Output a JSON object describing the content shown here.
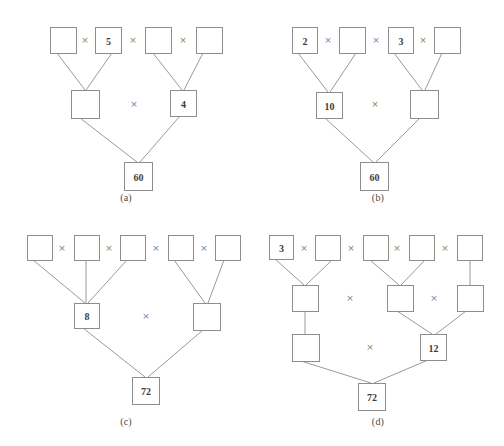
{
  "sheet": {
    "width": 504,
    "height": 446,
    "background": "#ffffff",
    "box_stroke": "#8d8d8d",
    "edge_stroke": "#9a9a9a",
    "text_color": "#3d3d3d",
    "operator_color": "#7e7e7e",
    "operator_symbol": "×"
  },
  "panels": [
    {
      "id": "a",
      "caption": "(a)",
      "origin": {
        "x": 0,
        "y": 0
      },
      "caption_y": 192,
      "boxes": [
        {
          "name": "a-top-1",
          "value": "",
          "x": 50,
          "y": 27,
          "w": 26,
          "h": 26
        },
        {
          "name": "a-top-2",
          "value": "5",
          "x": 95,
          "y": 27,
          "w": 26,
          "h": 26
        },
        {
          "name": "a-top-3",
          "value": "",
          "x": 145,
          "y": 27,
          "w": 26,
          "h": 26
        },
        {
          "name": "a-top-4",
          "value": "",
          "x": 196,
          "y": 27,
          "w": 26,
          "h": 26
        },
        {
          "name": "a-mid-1",
          "value": "",
          "x": 71,
          "y": 90,
          "w": 28,
          "h": 28
        },
        {
          "name": "a-mid-2",
          "value": "4",
          "x": 170,
          "y": 90,
          "w": 26,
          "h": 26
        },
        {
          "name": "a-root",
          "value": "60",
          "x": 124,
          "y": 162,
          "w": 28,
          "h": 28
        }
      ],
      "operators": [
        {
          "name": "a-op-top-1",
          "x": 85,
          "y": 40
        },
        {
          "name": "a-op-top-2",
          "x": 133,
          "y": 40
        },
        {
          "name": "a-op-top-3",
          "x": 183,
          "y": 40
        },
        {
          "name": "a-op-mid-1",
          "x": 134,
          "y": 104
        }
      ],
      "edges": [
        {
          "name": "a-edge-t1-m1",
          "x1": 57,
          "y1": 53,
          "x2": 85,
          "y2": 90
        },
        {
          "name": "a-edge-t2-m1",
          "x1": 112,
          "y1": 53,
          "x2": 86,
          "y2": 90
        },
        {
          "name": "a-edge-t3-m2",
          "x1": 153,
          "y1": 53,
          "x2": 182,
          "y2": 90
        },
        {
          "name": "a-edge-t4-m2",
          "x1": 203,
          "y1": 53,
          "x2": 184,
          "y2": 90
        },
        {
          "name": "a-edge-m1-root",
          "x1": 80,
          "y1": 118,
          "x2": 137,
          "y2": 162
        },
        {
          "name": "a-edge-m2-root",
          "x1": 180,
          "y1": 116,
          "x2": 140,
          "y2": 162
        }
      ]
    },
    {
      "id": "b",
      "caption": "(b)",
      "origin": {
        "x": 252,
        "y": 0
      },
      "caption_y": 192,
      "boxes": [
        {
          "name": "b-top-1",
          "value": "2",
          "x": 40,
          "y": 27,
          "w": 25,
          "h": 26
        },
        {
          "name": "b-top-2",
          "value": "",
          "x": 87,
          "y": 27,
          "w": 26,
          "h": 26
        },
        {
          "name": "b-top-3",
          "value": "3",
          "x": 136,
          "y": 27,
          "w": 25,
          "h": 26
        },
        {
          "name": "b-top-4",
          "value": "",
          "x": 182,
          "y": 27,
          "w": 26,
          "h": 26
        },
        {
          "name": "b-mid-1",
          "value": "10",
          "x": 64,
          "y": 92,
          "w": 26,
          "h": 26
        },
        {
          "name": "b-mid-2",
          "value": "",
          "x": 158,
          "y": 90,
          "w": 28,
          "h": 28
        },
        {
          "name": "b-root",
          "value": "60",
          "x": 108,
          "y": 162,
          "w": 28,
          "h": 28
        }
      ],
      "operators": [
        {
          "name": "b-op-top-1",
          "x": 76,
          "y": 40
        },
        {
          "name": "b-op-top-2",
          "x": 124,
          "y": 40
        },
        {
          "name": "b-op-top-3",
          "x": 171,
          "y": 40
        },
        {
          "name": "b-op-mid-1",
          "x": 123,
          "y": 104
        }
      ],
      "edges": [
        {
          "name": "b-edge-t1-m1",
          "x1": 46,
          "y1": 53,
          "x2": 76,
          "y2": 92
        },
        {
          "name": "b-edge-t2-m1",
          "x1": 104,
          "y1": 53,
          "x2": 78,
          "y2": 92
        },
        {
          "name": "b-edge-t3-m2",
          "x1": 142,
          "y1": 53,
          "x2": 170,
          "y2": 90
        },
        {
          "name": "b-edge-t4-m2",
          "x1": 190,
          "y1": 53,
          "x2": 173,
          "y2": 90
        },
        {
          "name": "b-edge-m1-root",
          "x1": 73,
          "y1": 118,
          "x2": 121,
          "y2": 162
        },
        {
          "name": "b-edge-m2-root",
          "x1": 168,
          "y1": 118,
          "x2": 124,
          "y2": 162
        }
      ]
    },
    {
      "id": "c",
      "caption": "(c)",
      "origin": {
        "x": 0,
        "y": 223
      },
      "caption_y": 193,
      "boxes": [
        {
          "name": "c-top-1",
          "value": "",
          "x": 27,
          "y": 12,
          "w": 25,
          "h": 25
        },
        {
          "name": "c-top-2",
          "value": "",
          "x": 74,
          "y": 12,
          "w": 25,
          "h": 25
        },
        {
          "name": "c-top-3",
          "value": "",
          "x": 120,
          "y": 12,
          "w": 25,
          "h": 25
        },
        {
          "name": "c-top-4",
          "value": "",
          "x": 168,
          "y": 12,
          "w": 25,
          "h": 25
        },
        {
          "name": "c-top-5",
          "value": "",
          "x": 215,
          "y": 12,
          "w": 25,
          "h": 25
        },
        {
          "name": "c-mid-1",
          "value": "8",
          "x": 74,
          "y": 80,
          "w": 25,
          "h": 25
        },
        {
          "name": "c-mid-2",
          "value": "",
          "x": 193,
          "y": 80,
          "w": 27,
          "h": 27
        },
        {
          "name": "c-root",
          "value": "72",
          "x": 132,
          "y": 154,
          "w": 27,
          "h": 27
        }
      ],
      "operators": [
        {
          "name": "c-op-top-1",
          "x": 62,
          "y": 25
        },
        {
          "name": "c-op-top-2",
          "x": 109,
          "y": 25
        },
        {
          "name": "c-op-top-3",
          "x": 156,
          "y": 25
        },
        {
          "name": "c-op-top-4",
          "x": 204,
          "y": 25
        },
        {
          "name": "c-op-mid-1",
          "x": 146,
          "y": 93
        }
      ],
      "edges": [
        {
          "name": "c-edge-t1-m1",
          "x1": 33,
          "y1": 37,
          "x2": 85,
          "y2": 80
        },
        {
          "name": "c-edge-t2-m1",
          "x1": 86,
          "y1": 37,
          "x2": 86,
          "y2": 80
        },
        {
          "name": "c-edge-t3-m1",
          "x1": 127,
          "y1": 37,
          "x2": 88,
          "y2": 80
        },
        {
          "name": "c-edge-t4-m2",
          "x1": 174,
          "y1": 37,
          "x2": 205,
          "y2": 80
        },
        {
          "name": "c-edge-t5-m2",
          "x1": 224,
          "y1": 37,
          "x2": 208,
          "y2": 80
        },
        {
          "name": "c-edge-m1-root",
          "x1": 83,
          "y1": 105,
          "x2": 145,
          "y2": 154
        },
        {
          "name": "c-edge-m2-root",
          "x1": 203,
          "y1": 107,
          "x2": 148,
          "y2": 154
        }
      ]
    },
    {
      "id": "d",
      "caption": "(d)",
      "origin": {
        "x": 252,
        "y": 223
      },
      "caption_y": 193,
      "boxes": [
        {
          "name": "d-top-1",
          "value": "3",
          "x": 17,
          "y": 12,
          "w": 24,
          "h": 24
        },
        {
          "name": "d-top-2",
          "value": "",
          "x": 63,
          "y": 12,
          "w": 25,
          "h": 25
        },
        {
          "name": "d-top-3",
          "value": "",
          "x": 111,
          "y": 12,
          "w": 25,
          "h": 25
        },
        {
          "name": "d-top-4",
          "value": "",
          "x": 157,
          "y": 12,
          "w": 25,
          "h": 25
        },
        {
          "name": "d-top-5",
          "value": "",
          "x": 205,
          "y": 12,
          "w": 25,
          "h": 25
        },
        {
          "name": "d-mid-1",
          "value": "",
          "x": 40,
          "y": 62,
          "w": 26,
          "h": 26
        },
        {
          "name": "d-mid-2",
          "value": "",
          "x": 135,
          "y": 62,
          "w": 26,
          "h": 26
        },
        {
          "name": "d-mid-3",
          "value": "",
          "x": 205,
          "y": 62,
          "w": 26,
          "h": 26
        },
        {
          "name": "d-low-1",
          "value": "",
          "x": 40,
          "y": 111,
          "w": 27,
          "h": 27
        },
        {
          "name": "d-low-2",
          "value": "12",
          "x": 168,
          "y": 111,
          "w": 26,
          "h": 26
        },
        {
          "name": "d-root",
          "value": "72",
          "x": 106,
          "y": 160,
          "w": 27,
          "h": 27
        }
      ],
      "operators": [
        {
          "name": "d-op-top-1",
          "x": 52,
          "y": 25
        },
        {
          "name": "d-op-top-2",
          "x": 99,
          "y": 25
        },
        {
          "name": "d-op-top-3",
          "x": 145,
          "y": 25
        },
        {
          "name": "d-op-top-4",
          "x": 193,
          "y": 25
        },
        {
          "name": "d-op-mid-1",
          "x": 98,
          "y": 75
        },
        {
          "name": "d-op-mid-2",
          "x": 182,
          "y": 75
        },
        {
          "name": "d-op-low-1",
          "x": 118,
          "y": 124
        }
      ],
      "edges": [
        {
          "name": "d-edge-t1-m1",
          "x1": 23,
          "y1": 36,
          "x2": 52,
          "y2": 62
        },
        {
          "name": "d-edge-t2-m1",
          "x1": 80,
          "y1": 37,
          "x2": 54,
          "y2": 62
        },
        {
          "name": "d-edge-t3-m2",
          "x1": 118,
          "y1": 37,
          "x2": 147,
          "y2": 62
        },
        {
          "name": "d-edge-t4-m2",
          "x1": 173,
          "y1": 37,
          "x2": 149,
          "y2": 62
        },
        {
          "name": "d-edge-t5-m3",
          "x1": 218,
          "y1": 37,
          "x2": 218,
          "y2": 62
        },
        {
          "name": "d-edge-m1-l1",
          "x1": 53,
          "y1": 88,
          "x2": 53,
          "y2": 111
        },
        {
          "name": "d-edge-m2-l2",
          "x1": 145,
          "y1": 88,
          "x2": 180,
          "y2": 111
        },
        {
          "name": "d-edge-m3-l2",
          "x1": 214,
          "y1": 88,
          "x2": 184,
          "y2": 111
        },
        {
          "name": "d-edge-l1-root",
          "x1": 49,
          "y1": 138,
          "x2": 119,
          "y2": 160
        },
        {
          "name": "d-edge-l2-root",
          "x1": 176,
          "y1": 137,
          "x2": 122,
          "y2": 160
        }
      ]
    }
  ]
}
